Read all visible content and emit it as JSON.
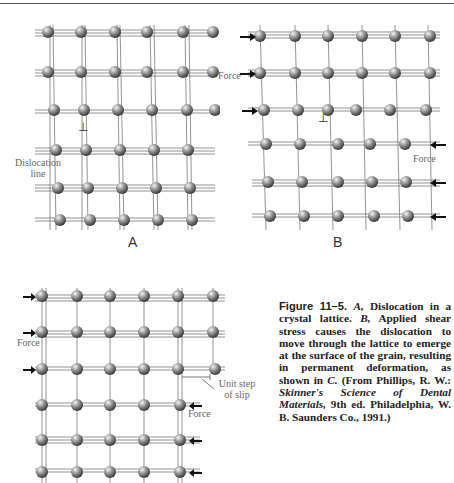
{
  "figure": {
    "panels": [
      {
        "id": "A",
        "label": "A",
        "annotations": [
          "Dislocation line"
        ]
      },
      {
        "id": "B",
        "label": "B",
        "annotations": [
          "Force",
          "Force"
        ]
      },
      {
        "id": "C",
        "label": "",
        "annotations": [
          "Force",
          "Force",
          "Unit step of slip"
        ]
      }
    ],
    "dislocation_symbol": "⊥",
    "labels": {
      "a": "A",
      "b": "B",
      "dislocation_line_1": "Dislocation",
      "dislocation_line_2": "line",
      "force_b_left": "Force",
      "force_b_right": "Force",
      "force_c_left": "Force",
      "force_c_right": "Force",
      "unit_step_1": "Unit step",
      "unit_step_2": "of slip"
    }
  },
  "caption": {
    "figure_number": "Figure 11–5.",
    "part_a": "A,",
    "text_a": " Dislocation in a crystal lattice. ",
    "part_b": "B,",
    "text_b": " Applied shear stress causes the dislocation to move through the lattice to emerge at the surface of the grain, resulting in permanent deformation, as shown in ",
    "part_c": "C.",
    "source_prefix": " (From Phillips, R. W.: ",
    "source_title": "Skinner's Science of Dental Materials,",
    "source_suffix": " 9th ed. Philadelphia, W. B. Saunders Co., 1991.)"
  }
}
